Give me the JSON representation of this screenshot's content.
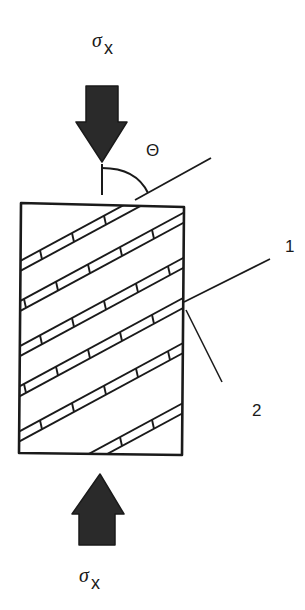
{
  "diagram": {
    "type": "uniaxial-compression-of-layered-specimen",
    "colors": {
      "stroke": "#1a1a1a",
      "arrow_fill": "#2a2a2a",
      "background": "#ffffff"
    },
    "top_load": {
      "symbol": "σ",
      "subscript": "x",
      "direction": "down"
    },
    "bottom_load": {
      "symbol": "σ",
      "subscript": "x",
      "direction": "up"
    },
    "angle": {
      "label": "Θ"
    },
    "callouts": [
      {
        "label": "1",
        "target": "fiber/layer direction"
      },
      {
        "label": "2",
        "target": "interface between layers"
      }
    ],
    "specimen": {
      "band_count": 6,
      "band_angle_deg": 28
    }
  }
}
